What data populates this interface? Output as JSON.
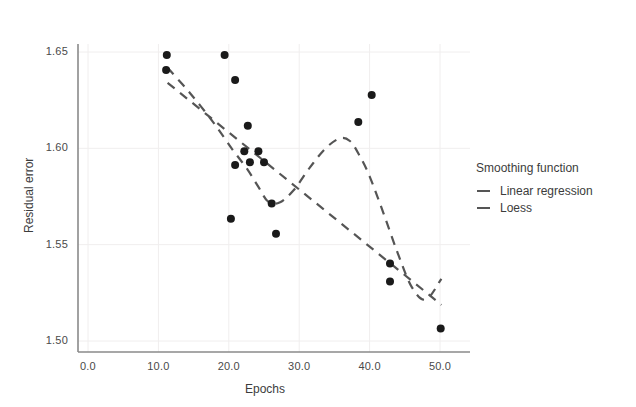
{
  "chart_data": {
    "type": "scatter",
    "title": "",
    "xlabel": "Epochs",
    "ylabel": "Residual error",
    "xlim": [
      0,
      52
    ],
    "ylim": [
      1.4875,
      1.6575
    ],
    "xticks": [
      "0.0",
      "10.0",
      "20.0",
      "30.0",
      "40.0",
      "50.0"
    ],
    "xtick_values": [
      0,
      10,
      20,
      30,
      40,
      50
    ],
    "yticks": [
      "1.50",
      "1.55",
      "1.60",
      "1.65"
    ],
    "ytick_values": [
      1.5,
      1.55,
      1.6,
      1.65
    ],
    "grid": true,
    "legend_position": "right",
    "points": [
      {
        "x": 11.2,
        "y": 1.6485
      },
      {
        "x": 11.1,
        "y": 1.6407
      },
      {
        "x": 19.4,
        "y": 1.6485
      },
      {
        "x": 20.9,
        "y": 1.6355
      },
      {
        "x": 22.7,
        "y": 1.6117
      },
      {
        "x": 22.2,
        "y": 1.5985
      },
      {
        "x": 24.2,
        "y": 1.5985
      },
      {
        "x": 23.0,
        "y": 1.5928
      },
      {
        "x": 25.0,
        "y": 1.5928
      },
      {
        "x": 20.9,
        "y": 1.5913
      },
      {
        "x": 26.1,
        "y": 1.5713
      },
      {
        "x": 20.3,
        "y": 1.5635
      },
      {
        "x": 26.7,
        "y": 1.5557
      },
      {
        "x": 40.3,
        "y": 1.6277
      },
      {
        "x": 38.4,
        "y": 1.6137
      },
      {
        "x": 42.9,
        "y": 1.5402
      },
      {
        "x": 42.9,
        "y": 1.5309
      },
      {
        "x": 50.1,
        "y": 1.5065
      }
    ],
    "series": [
      {
        "name": "Linear regression",
        "style": "dashed",
        "color": "#555555",
        "x": [
          11.3,
          50.2
        ],
        "y": [
          1.634,
          1.5188
        ]
      },
      {
        "name": "Loess",
        "style": "dashed",
        "color": "#555555",
        "x": [
          11.3,
          14.5,
          17.8,
          20.5,
          22.6,
          24.2,
          25.6,
          27.2,
          29.2,
          31.5,
          33.8,
          35.8,
          37.2,
          38.5,
          40.0,
          42.0,
          44.0,
          46.0,
          48.0,
          50.2
        ],
        "y": [
          1.6418,
          1.6286,
          1.6135,
          1.5995,
          1.5893,
          1.58,
          1.5723,
          1.5719,
          1.5782,
          1.59,
          1.6002,
          1.6052,
          1.6038,
          1.5967,
          1.5855,
          1.566,
          1.5455,
          1.528,
          1.5215,
          1.5323
        ]
      }
    ],
    "legend": {
      "title": "Smoothing function",
      "entries": [
        "Linear regression",
        "Loess"
      ]
    },
    "point_color": "#1a1a1a",
    "grid_color": "#f0eeee",
    "axis_color": "#8a8a8a"
  }
}
